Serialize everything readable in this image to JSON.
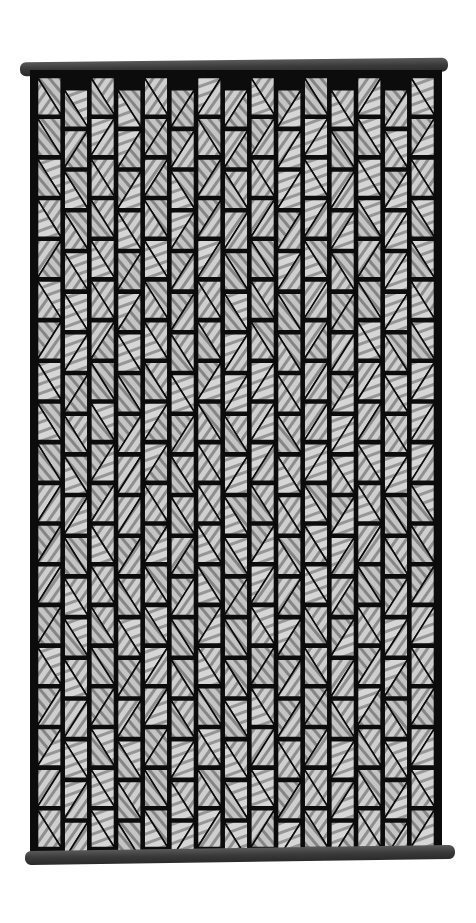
{
  "image": {
    "subject": "woven wall hanging",
    "tones": {
      "background": "#ffffff",
      "frame": "#0c0c0c",
      "rod": "#3a3a3a",
      "light": "#c8c8c8",
      "mid": "#8a8a8a"
    },
    "grid": {
      "columns": 15,
      "rows": 19
    }
  }
}
